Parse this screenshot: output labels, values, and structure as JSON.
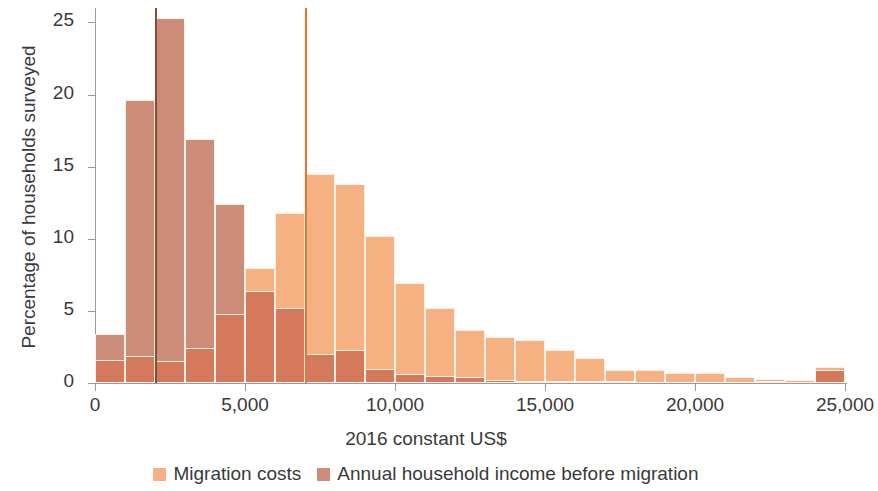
{
  "chart_data": {
    "type": "bar",
    "title": "",
    "xlabel": "2016 constant US$",
    "ylabel": "Percentage of households surveyed",
    "xlim": [
      0,
      25000
    ],
    "ylim": [
      0,
      26
    ],
    "xticks": [
      "0",
      "5,000",
      "10,000",
      "15,000",
      "20,000",
      "25,000"
    ],
    "xtick_values": [
      0,
      5000,
      10000,
      15000,
      20000,
      25000
    ],
    "yticks": [
      "0",
      "5",
      "10",
      "15",
      "20",
      "25"
    ],
    "ytick_values": [
      0,
      5,
      10,
      15,
      20,
      25
    ],
    "grid": false,
    "bin_width": 1000,
    "bin_starts": [
      0,
      1000,
      2000,
      3000,
      4000,
      5000,
      6000,
      7000,
      8000,
      9000,
      10000,
      11000,
      12000,
      13000,
      14000,
      15000,
      16000,
      17000,
      18000,
      19000,
      20000,
      21000,
      22000,
      23000,
      24000
    ],
    "series": [
      {
        "name": "Migration costs",
        "color": "#f6b183",
        "values": [
          1.6,
          1.9,
          1.5,
          2.4,
          4.8,
          8.0,
          11.8,
          14.5,
          13.8,
          10.2,
          6.9,
          5.2,
          3.7,
          3.2,
          3.0,
          2.3,
          1.7,
          0.9,
          0.9,
          0.7,
          0.7,
          0.4,
          0.3,
          0.2,
          1.1
        ]
      },
      {
        "name": "Annual household income before migration",
        "color": "#cd8c77",
        "values": [
          3.4,
          19.6,
          25.3,
          16.9,
          12.4,
          6.4,
          5.2,
          2.0,
          2.3,
          1.0,
          0.6,
          0.5,
          0.4,
          0.2,
          0.1,
          0.05,
          0.05,
          0.05,
          0.0,
          0.0,
          0.0,
          0.0,
          0.05,
          0.0,
          0.9
        ]
      }
    ],
    "median_markers": [
      {
        "name": "median-income-line",
        "value": 2000,
        "color": "#8c4a38"
      },
      {
        "name": "median-migration-cost-line",
        "value": 7000,
        "color": "#f4712b"
      }
    ],
    "legend": {
      "position": "bottom",
      "entries": [
        {
          "label": "Migration costs",
          "color": "#f6b183"
        },
        {
          "label": "Annual household income before migration",
          "color": "#cd8c77"
        }
      ]
    },
    "colors": {
      "costs": "#f6b183",
      "income": "#cd8c77",
      "overlap": "#d4795b",
      "axis": "#9a9a9a",
      "text": "#3a3a3a",
      "background": "#ffffff"
    }
  }
}
